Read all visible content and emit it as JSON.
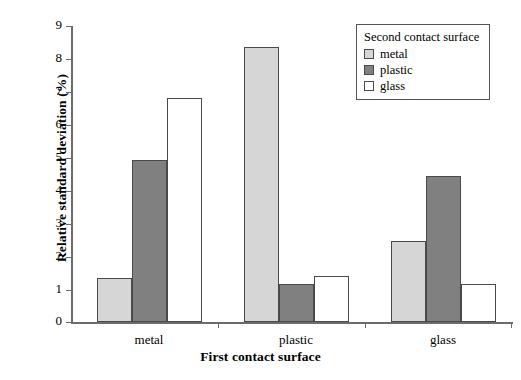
{
  "chart_data": {
    "type": "bar",
    "title": "",
    "xlabel": "First contact surface",
    "ylabel": "Relative standard deviation (%)",
    "categories": [
      "metal",
      "plastic",
      "glass"
    ],
    "series": [
      {
        "name": "metal",
        "color": "#d6d6d6",
        "values": [
          1.35,
          8.35,
          2.45
        ]
      },
      {
        "name": "plastic",
        "color": "#808080",
        "values": [
          4.92,
          1.15,
          4.45
        ]
      },
      {
        "name": "glass",
        "color": "#ffffff",
        "values": [
          6.82,
          1.4,
          1.17
        ]
      }
    ],
    "ylim": [
      0,
      9
    ],
    "yticks": [
      0,
      1,
      2,
      3,
      4,
      5,
      6,
      7,
      8,
      9
    ],
    "ytick_labels": [
      "0",
      "1",
      "2",
      "3",
      "4",
      "5",
      "6",
      "7",
      "8",
      "9"
    ],
    "grid": false,
    "legend": {
      "position": "top-right",
      "title": "Second contact surface",
      "entries": [
        "metal",
        "plastic",
        "glass"
      ]
    }
  },
  "legend": {
    "title": "Second contact surface",
    "items": [
      {
        "label": "metal"
      },
      {
        "label": "plastic"
      },
      {
        "label": "glass"
      }
    ]
  },
  "axes": {
    "y_title": "Relative standard deviation (%)",
    "x_title": "First contact surface",
    "y_tick_labels": [
      "9",
      "8",
      "7",
      "6",
      "5",
      "4",
      "3",
      "2",
      "1",
      "0"
    ],
    "x_tick_labels": [
      "metal",
      "plastic",
      "glass"
    ]
  }
}
